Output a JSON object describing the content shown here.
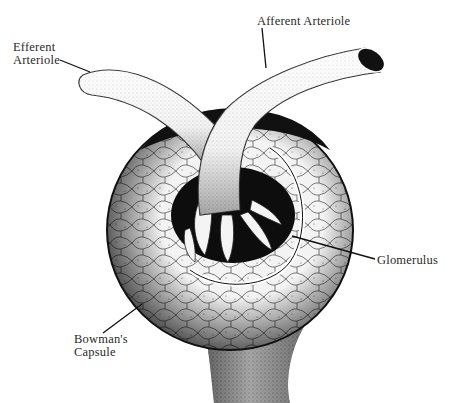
{
  "figure": {
    "style": "black-and-white stippled anatomical illustration"
  },
  "labels": {
    "efferent_line1": "Efferent",
    "efferent_line2": "Arteriole",
    "afferent": "Afferent Arteriole",
    "glomerulus": "Glomerulus",
    "bowman_line1": "Bowman's",
    "bowman_line2": "Capsule"
  },
  "colors": {
    "ink": "#111111",
    "paper": "#ffffff",
    "text": "#2a2a2a"
  }
}
